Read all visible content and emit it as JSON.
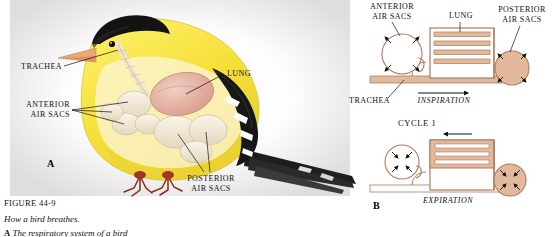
{
  "figure": {
    "number": "FIGURE 44-9",
    "title": "How a bird breathes.",
    "part_a_letter": "A",
    "part_a_caption": "The respiratory system of a bird",
    "panel_a_letter": "A",
    "panel_b_letter": "B"
  },
  "bird_labels": {
    "trachea": "TRACHEA",
    "anterior_air_sacs": "ANTERIOR\nAIR SACS",
    "lung": "LUNG",
    "posterior_air_sacs": "POSTERIOR\nAIR SACS"
  },
  "schematic": {
    "anterior_air_sacs": "ANTERIOR\nAIR SACS",
    "lung": "LUNG",
    "posterior_air_sacs": "POSTERIOR\nAIR SACS",
    "trachea": "TRACHEA",
    "inspiration": "INSPIRATION",
    "expiration": "EXPIRATION",
    "cycle": "CYCLE 1"
  },
  "colors": {
    "tan_fill": "#e3b99e",
    "tan_line": "#b07a5c",
    "bird_yellow": "#f6e03a",
    "bird_black": "#1a1a1a",
    "bird_beak": "#e8a878",
    "lung_pink": "#e9b9ab",
    "air_sac_cream": "#efe7d6",
    "label_black": "#101010",
    "background": "#ffffff"
  }
}
